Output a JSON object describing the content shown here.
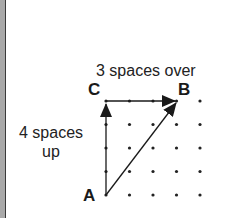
{
  "diagram": {
    "points": {
      "A": {
        "label": "A",
        "col": 0,
        "row": 4
      },
      "B": {
        "label": "B",
        "col": 3,
        "row": 0
      },
      "C": {
        "label": "C",
        "col": 0,
        "row": 0
      }
    },
    "labels": {
      "horizontal": "3 spaces over",
      "vertical_line1": "4 spaces",
      "vertical_line2": "up"
    },
    "grid": {
      "cols": 5,
      "rows": 5,
      "origin_x": 106,
      "origin_y": 101,
      "spacing": 23.5
    },
    "arrows": [
      {
        "from": "A",
        "to": "C",
        "name": "vertical-arrow"
      },
      {
        "from": "C",
        "to": "B",
        "name": "horizontal-arrow"
      },
      {
        "from": "A",
        "to": "B",
        "name": "diagonal-arrow"
      }
    ],
    "colors": {
      "ink": "#222222",
      "border": "#a9a9a9"
    }
  }
}
